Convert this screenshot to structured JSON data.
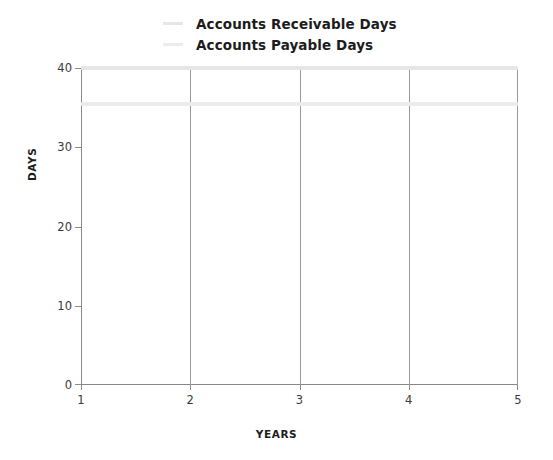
{
  "chart_data": {
    "type": "line",
    "title": "",
    "xlabel": "YEARS",
    "ylabel": "DAYS",
    "x": [
      1,
      2,
      3,
      4,
      5
    ],
    "xlim": [
      1,
      5
    ],
    "ylim": [
      0,
      40
    ],
    "xticks": [
      "1",
      "2",
      "3",
      "4",
      "5"
    ],
    "yticks": [
      "0",
      "10",
      "20",
      "30",
      "40"
    ],
    "grid": "vertical",
    "legend_position": "top-center",
    "series": [
      {
        "name": "Accounts Receivable Days",
        "color": "#e6e6e6",
        "values": [
          40,
          40,
          40,
          40,
          40
        ]
      },
      {
        "name": "Accounts Payable Days",
        "color": "#ececec",
        "values": [
          35.5,
          35.5,
          35.5,
          35.5,
          35.5
        ]
      }
    ]
  },
  "axes": {
    "y_title": "DAYS",
    "x_title": "YEARS",
    "y_tick_labels": [
      "40",
      "30",
      "20",
      "10",
      "0"
    ],
    "x_tick_labels": [
      "1",
      "2",
      "3",
      "4",
      "5"
    ]
  },
  "legend": {
    "items": [
      {
        "label": "Accounts Receivable Days",
        "color": "#e6e6e6"
      },
      {
        "label": "Accounts Payable Days",
        "color": "#ececec"
      }
    ]
  },
  "colors": {
    "axis": "#888888",
    "gridline": "#9a9a9a",
    "text": "#1c1c1c",
    "background": "#ffffff"
  }
}
